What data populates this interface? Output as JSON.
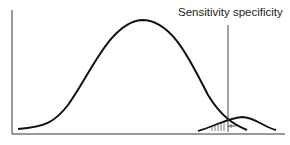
{
  "diagram": {
    "label": "Sensitivity specificity",
    "elements": {
      "large_curve": "healthy population distribution (bell curve)",
      "small_curve": "diseased population distribution (small bell curve)",
      "cutoff_line": "vertical threshold line",
      "hatched_region": "overlap area below cutoff"
    },
    "colors": {
      "stroke": "#111111",
      "background": "#ffffff"
    }
  }
}
